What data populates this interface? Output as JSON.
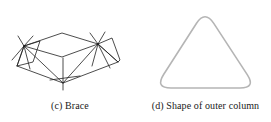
{
  "figure": {
    "background_color": "#ffffff",
    "width": 271,
    "height": 122,
    "panels": [
      {
        "id": "brace",
        "caption": "(c) Brace",
        "artwork_name": "brace-truss-line-drawing",
        "line_color": "#1f1f1f",
        "description": "Three-dimensional wireframe line drawing of a bracing truss unit, symmetric about a vertical centre line, with two dense radiating nodes at left and right"
      },
      {
        "id": "column",
        "caption": "(d) Shape of outer column",
        "artwork_name": "rounded-triangle-outline",
        "line_color": "#b5b5b5",
        "description": "Light grey outline of a rounded equilateral triangle representing the cross-sectional shape of the outer column"
      }
    ]
  },
  "chart_data": {
    "type": "line",
    "title": "",
    "brace_geometry": {
      "name": "(c) Brace",
      "stroke": "#1f1f1f",
      "stroke_width": 0.8,
      "nodes": {
        "left_hub": [
          24,
          46
        ],
        "right_hub": [
          98,
          44
        ],
        "top_apex": [
          62,
          33
        ],
        "bottom_center": [
          63,
          83
        ],
        "left_lower": [
          17,
          66
        ],
        "right_lower": [
          118,
          62
        ],
        "left_outer_top": [
          33,
          36
        ],
        "right_outer_top": [
          90,
          33
        ]
      },
      "polylines": [
        [
          [
            24,
            46
          ],
          [
            62,
            33
          ],
          [
            98,
            44
          ]
        ],
        [
          [
            24,
            46
          ],
          [
            62,
            57
          ],
          [
            98,
            44
          ]
        ],
        [
          [
            17,
            66
          ],
          [
            63,
            83
          ],
          [
            118,
            62
          ]
        ],
        [
          [
            24,
            46
          ],
          [
            17,
            66
          ]
        ],
        [
          [
            98,
            44
          ],
          [
            118,
            62
          ]
        ],
        [
          [
            24,
            46
          ],
          [
            63,
            83
          ]
        ],
        [
          [
            98,
            44
          ],
          [
            63,
            83
          ]
        ],
        [
          [
            24,
            46
          ],
          [
            40,
            41
          ],
          [
            33,
            62
          ],
          [
            17,
            66
          ],
          [
            24,
            46
          ]
        ],
        [
          [
            98,
            44
          ],
          [
            112,
            38
          ],
          [
            120,
            60
          ],
          [
            118,
            62
          ],
          [
            98,
            44
          ]
        ],
        [
          [
            63,
            58
          ],
          [
            63,
            90
          ]
        ],
        [
          [
            50,
            80
          ],
          [
            80,
            76
          ]
        ],
        [
          [
            24,
            46
          ],
          [
            33,
            36
          ]
        ],
        [
          [
            24,
            46
          ],
          [
            18,
            36
          ]
        ],
        [
          [
            24,
            46
          ],
          [
            30,
            69
          ]
        ],
        [
          [
            24,
            46
          ],
          [
            12,
            60
          ]
        ],
        [
          [
            98,
            44
          ],
          [
            90,
            33
          ]
        ],
        [
          [
            98,
            44
          ],
          [
            105,
            32
          ]
        ],
        [
          [
            98,
            44
          ],
          [
            92,
            66
          ]
        ],
        [
          [
            98,
            44
          ],
          [
            110,
            68
          ]
        ]
      ]
    },
    "column_geometry": {
      "name": "(d) Shape of outer column",
      "stroke": "#b5b5b5",
      "stroke_width": 1.6,
      "shape": "rounded-triangle",
      "apex": [
        205,
        10
      ],
      "bottom_left": [
        155,
        88
      ],
      "bottom_right": [
        256,
        88
      ],
      "corner_radius": 16
    }
  }
}
